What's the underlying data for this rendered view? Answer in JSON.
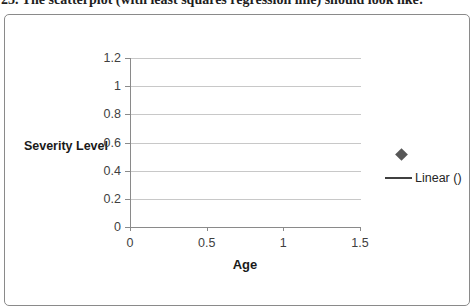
{
  "question": {
    "text": "23. The scatterplot (with least squares regression line) should look like:"
  },
  "chart_data": {
    "type": "scatter",
    "title": "",
    "xlabel": "Age",
    "ylabel": "Severity Level",
    "xlim": [
      0,
      1.5
    ],
    "ylim": [
      0,
      1.2
    ],
    "xticks": [
      "0",
      "0.5",
      "1",
      "1.5"
    ],
    "yticks": [
      "0",
      "0.2",
      "0.4",
      "0.6",
      "0.8",
      "1",
      "1.2"
    ],
    "grid": true,
    "legend": {
      "position": "right",
      "entries": [
        {
          "type": "marker",
          "icon": "diamond-marker",
          "label": ""
        },
        {
          "type": "line",
          "icon": "trendline",
          "label": "Linear ()"
        }
      ]
    },
    "series": [
      {
        "name": "",
        "marker": "diamond",
        "points": []
      }
    ]
  },
  "colors": {
    "frame_border": "#8a8a8a",
    "gridline": "#c8c8c8",
    "axis": "#8a8a8a",
    "tick_label": "#3f3f3f",
    "axis_title": "#1a1a1a",
    "marker": "#575757",
    "legend_line": "#404040",
    "question_text": "#1f1f1f"
  }
}
